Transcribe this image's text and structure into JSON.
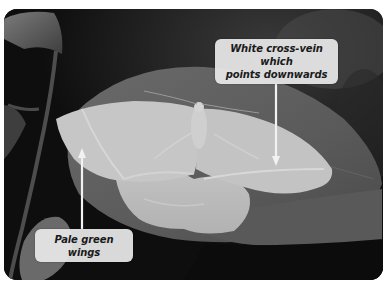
{
  "image": {
    "subject": "moth",
    "color_mode": "grayscale",
    "colors": {
      "background_dark": "#0d0d0d",
      "leaf": "#5e5e5e",
      "wing": "#bdbdbd",
      "wing_light": "#d2d2d2",
      "callout_bg": "#e8e8e8",
      "callout_text": "#1a1a1a",
      "arrow": "#f2f2f2"
    }
  },
  "annotations": [
    {
      "id": "cross-vein",
      "label_line1": "White cross-vein which",
      "label_line2": "points downwards",
      "arrow_direction": "down"
    },
    {
      "id": "wings",
      "label": "Pale green wings",
      "arrow_direction": "up"
    }
  ]
}
